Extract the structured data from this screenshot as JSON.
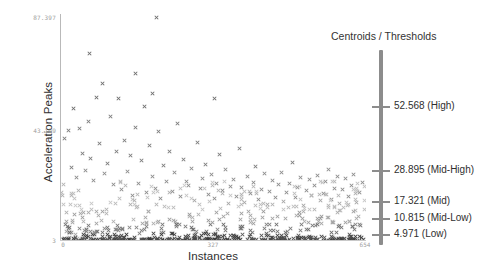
{
  "chart_data": {
    "type": "scatter",
    "title": "",
    "xlabel": "Instances",
    "ylabel": "Acceleration Peaks",
    "xlim": [
      0,
      654
    ],
    "ylim": [
      3,
      87.397
    ],
    "xticks": [
      "0",
      "327",
      "654"
    ],
    "yticks": [
      "87.397",
      "43.199",
      "3"
    ],
    "grid": false,
    "marker": "x",
    "legend_position": "right",
    "legend_title": "Centroids / Thresholds",
    "thresholds": [
      {
        "value": 52.568,
        "label": "52.568 (High)",
        "name": "High"
      },
      {
        "value": 28.895,
        "label": "28.895 (Mid-High)",
        "name": "Mid-High"
      },
      {
        "value": 17.321,
        "label": "17.321 (Mid)",
        "name": "Mid"
      },
      {
        "value": 10.815,
        "label": "10.815 (Mid-Low)",
        "name": "Mid-Low"
      },
      {
        "value": 4.971,
        "label": "4.971 (Low)",
        "name": "Low"
      }
    ],
    "point_count": 654,
    "points": [
      [
        12,
        6.2
      ],
      [
        18,
        4.1
      ],
      [
        24,
        9.5
      ],
      [
        30,
        5.0
      ],
      [
        36,
        3.6
      ],
      [
        42,
        12.8
      ],
      [
        48,
        4.4
      ],
      [
        54,
        7.1
      ],
      [
        8,
        41.0
      ],
      [
        16,
        43.8
      ],
      [
        22,
        30.1
      ],
      [
        26,
        52.0
      ],
      [
        34,
        26.5
      ],
      [
        40,
        44.7
      ],
      [
        46,
        35.2
      ],
      [
        52,
        29.0
      ],
      [
        58,
        47.3
      ],
      [
        64,
        33.6
      ],
      [
        70,
        25.4
      ],
      [
        76,
        56.2
      ],
      [
        82,
        38.9
      ],
      [
        88,
        61.5
      ],
      [
        94,
        27.8
      ],
      [
        100,
        31.4
      ],
      [
        106,
        49.2
      ],
      [
        112,
        23.7
      ],
      [
        118,
        36.1
      ],
      [
        124,
        55.8
      ],
      [
        130,
        21.9
      ],
      [
        136,
        40.3
      ],
      [
        142,
        28.6
      ],
      [
        148,
        34.5
      ],
      [
        154,
        19.8
      ],
      [
        160,
        45.1
      ],
      [
        166,
        24.3
      ],
      [
        172,
        32.7
      ],
      [
        178,
        53.0
      ],
      [
        184,
        20.6
      ],
      [
        190,
        38.2
      ],
      [
        196,
        26.9
      ],
      [
        202,
        22.1
      ],
      [
        208,
        43.5
      ],
      [
        214,
        18.4
      ],
      [
        220,
        30.8
      ],
      [
        226,
        25.0
      ],
      [
        232,
        35.9
      ],
      [
        238,
        21.3
      ],
      [
        244,
        28.2
      ],
      [
        250,
        46.4
      ],
      [
        256,
        19.1
      ],
      [
        262,
        33.0
      ],
      [
        268,
        24.8
      ],
      [
        274,
        23.5
      ],
      [
        280,
        29.7
      ],
      [
        286,
        17.9
      ],
      [
        292,
        39.6
      ],
      [
        298,
        22.4
      ],
      [
        304,
        26.1
      ],
      [
        310,
        31.2
      ],
      [
        316,
        20.0
      ],
      [
        322,
        27.3
      ],
      [
        328,
        18.7
      ],
      [
        334,
        24.0
      ],
      [
        340,
        34.8
      ],
      [
        346,
        21.6
      ],
      [
        352,
        29.2
      ],
      [
        358,
        16.8
      ],
      [
        364,
        23.1
      ],
      [
        370,
        25.7
      ],
      [
        376,
        19.4
      ],
      [
        382,
        37.1
      ],
      [
        388,
        22.8
      ],
      [
        394,
        17.2
      ],
      [
        400,
        26.6
      ],
      [
        406,
        20.3
      ],
      [
        412,
        24.5
      ],
      [
        418,
        30.4
      ],
      [
        424,
        18.1
      ],
      [
        430,
        22.0
      ],
      [
        436,
        27.9
      ],
      [
        442,
        16.3
      ],
      [
        448,
        21.1
      ],
      [
        454,
        25.2
      ],
      [
        460,
        19.0
      ],
      [
        466,
        23.8
      ],
      [
        472,
        28.4
      ],
      [
        478,
        17.5
      ],
      [
        484,
        20.8
      ],
      [
        490,
        24.1
      ],
      [
        496,
        31.9
      ],
      [
        502,
        18.9
      ],
      [
        508,
        22.6
      ],
      [
        514,
        26.3
      ],
      [
        520,
        16.0
      ],
      [
        526,
        21.4
      ],
      [
        532,
        25.5
      ],
      [
        538,
        19.7
      ],
      [
        544,
        23.2
      ],
      [
        550,
        27.0
      ],
      [
        556,
        17.8
      ],
      [
        562,
        20.5
      ],
      [
        568,
        24.7
      ],
      [
        574,
        29.5
      ],
      [
        580,
        18.3
      ],
      [
        586,
        22.3
      ],
      [
        592,
        26.8
      ],
      [
        598,
        16.5
      ],
      [
        604,
        21.8
      ],
      [
        610,
        25.9
      ],
      [
        616,
        19.3
      ],
      [
        622,
        23.4
      ],
      [
        628,
        27.6
      ],
      [
        634,
        17.0
      ],
      [
        640,
        20.9
      ],
      [
        646,
        24.4
      ],
      [
        204,
        86.0
      ],
      [
        62,
        72.5
      ],
      [
        196,
        57.8
      ],
      [
        330,
        56.0
      ],
      [
        160,
        65.2
      ]
    ]
  }
}
